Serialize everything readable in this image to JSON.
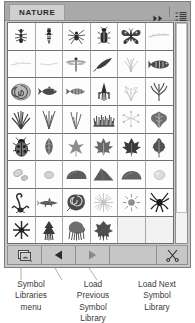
{
  "panel": {
    "tab_label": "NATURE",
    "header": {
      "collapse_icon": "double-chevron-right-icon",
      "menu_icon": "panel-menu-icon"
    },
    "accent_colors": {
      "panel_bg": "#c8c8c8",
      "header_bg": "#a9a9a9",
      "tab_bg": "#cfcfcf",
      "grid_bg": "#ffffff",
      "border": "#7d7d7d",
      "toolbar_bg": "#c2c2c2"
    }
  },
  "grid": {
    "columns": 6,
    "rows": 8,
    "symbols": [
      {
        "name": "ant",
        "row": 1,
        "col": 1,
        "icon": "ant-symbol"
      },
      {
        "name": "wasp",
        "row": 1,
        "col": 2,
        "icon": "wasp-symbol"
      },
      {
        "name": "spider",
        "row": 1,
        "col": 3,
        "icon": "spider-symbol"
      },
      {
        "name": "beetle",
        "row": 1,
        "col": 4,
        "icon": "beetle-symbol"
      },
      {
        "name": "butterfly",
        "row": 1,
        "col": 5,
        "icon": "butterfly-symbol"
      },
      {
        "name": "twig",
        "row": 1,
        "col": 6,
        "icon": "twig-symbol"
      },
      {
        "name": "branch-faint",
        "row": 2,
        "col": 1,
        "icon": "branch-symbol"
      },
      {
        "name": "stem-faint",
        "row": 2,
        "col": 2,
        "icon": "stem-symbol"
      },
      {
        "name": "dragonfly",
        "row": 2,
        "col": 3,
        "icon": "dragonfly-symbol"
      },
      {
        "name": "feather",
        "row": 2,
        "col": 4,
        "icon": "feather-symbol"
      },
      {
        "name": "sprout",
        "row": 2,
        "col": 5,
        "icon": "sprout-symbol"
      },
      {
        "name": "fish-oval",
        "row": 2,
        "col": 6,
        "icon": "fish-oval-symbol"
      },
      {
        "name": "nautilus-shell",
        "row": 3,
        "col": 1,
        "icon": "nautilus-symbol"
      },
      {
        "name": "fish",
        "row": 3,
        "col": 2,
        "icon": "fish-symbol"
      },
      {
        "name": "fish-striped",
        "row": 3,
        "col": 3,
        "icon": "fish-striped-symbol"
      },
      {
        "name": "squid",
        "row": 3,
        "col": 4,
        "icon": "squid-symbol"
      },
      {
        "name": "seaweed",
        "row": 3,
        "col": 5,
        "icon": "seaweed-symbol"
      },
      {
        "name": "coral",
        "row": 3,
        "col": 6,
        "icon": "coral-symbol"
      },
      {
        "name": "grass-clump",
        "row": 4,
        "col": 1,
        "icon": "grass-clump-symbol"
      },
      {
        "name": "grass-blades",
        "row": 4,
        "col": 2,
        "icon": "grass-blades-symbol"
      },
      {
        "name": "grass-tuft",
        "row": 4,
        "col": 3,
        "icon": "grass-tuft-symbol"
      },
      {
        "name": "grass-dense",
        "row": 4,
        "col": 4,
        "icon": "grass-dense-symbol"
      },
      {
        "name": "scatter-dots",
        "row": 4,
        "col": 5,
        "icon": "scatter-symbol"
      },
      {
        "name": "leaf-ivy",
        "row": 4,
        "col": 6,
        "icon": "ivy-leaf-symbol"
      },
      {
        "name": "ladybug",
        "row": 5,
        "col": 1,
        "icon": "ladybug-symbol"
      },
      {
        "name": "leaf-simple",
        "row": 5,
        "col": 2,
        "icon": "leaf-symbol"
      },
      {
        "name": "leaf-star",
        "row": 5,
        "col": 3,
        "icon": "star-leaf-symbol"
      },
      {
        "name": "maple-leaf",
        "row": 5,
        "col": 4,
        "icon": "maple-leaf-symbol"
      },
      {
        "name": "maple-leaf-dark",
        "row": 5,
        "col": 5,
        "icon": "maple-leaf-dark-symbol"
      },
      {
        "name": "oak-leaf",
        "row": 5,
        "col": 6,
        "icon": "oak-leaf-symbol"
      },
      {
        "name": "pebbles",
        "row": 6,
        "col": 1,
        "icon": "pebbles-symbol"
      },
      {
        "name": "pebble-small",
        "row": 6,
        "col": 2,
        "icon": "pebble-symbol"
      },
      {
        "name": "stone",
        "row": 6,
        "col": 3,
        "icon": "stone-symbol"
      },
      {
        "name": "boulder",
        "row": 6,
        "col": 4,
        "icon": "boulder-symbol"
      },
      {
        "name": "rock",
        "row": 6,
        "col": 5,
        "icon": "rock-symbol"
      },
      {
        "name": "stone-light",
        "row": 6,
        "col": 6,
        "icon": "stone-light-symbol"
      },
      {
        "name": "scorpion",
        "row": 7,
        "col": 1,
        "icon": "scorpion-symbol"
      },
      {
        "name": "shark",
        "row": 7,
        "col": 2,
        "icon": "shark-symbol"
      },
      {
        "name": "snail-shell",
        "row": 7,
        "col": 3,
        "icon": "snail-shell-symbol"
      },
      {
        "name": "starburst",
        "row": 7,
        "col": 4,
        "icon": "starburst-symbol"
      },
      {
        "name": "sun",
        "row": 7,
        "col": 5,
        "icon": "sun-symbol"
      },
      {
        "name": "spider-dark",
        "row": 7,
        "col": 6,
        "icon": "spider-dark-symbol"
      },
      {
        "name": "star-dark",
        "row": 8,
        "col": 1,
        "icon": "star-dark-symbol"
      },
      {
        "name": "pine-tree",
        "row": 8,
        "col": 2,
        "icon": "pine-tree-symbol"
      },
      {
        "name": "bush",
        "row": 8,
        "col": 3,
        "icon": "bush-symbol"
      },
      {
        "name": "shrub",
        "row": 8,
        "col": 4,
        "icon": "shrub-symbol"
      }
    ],
    "empty_cells": 2
  },
  "scrollbar": {
    "orientation": "vertical",
    "thumb_position": "top"
  },
  "toolbar": {
    "buttons": [
      {
        "name": "symbol-libraries-menu",
        "icon": "libraries-stack-icon"
      },
      {
        "name": "load-previous-library",
        "icon": "left-triangle-icon"
      },
      {
        "name": "load-next-library",
        "icon": "right-triangle-icon"
      },
      {
        "name": "delete-symbol",
        "icon": "scissors-icon"
      }
    ]
  },
  "captions": [
    {
      "id": "symbol-libraries-menu-caption",
      "text": "Symbol\nLibraries\nmenu"
    },
    {
      "id": "load-previous-caption",
      "text": "Load\nPrevious\nSymbol\nLibrary"
    },
    {
      "id": "load-next-caption",
      "text": "Load Next\nSymbol\nLibrary"
    }
  ]
}
